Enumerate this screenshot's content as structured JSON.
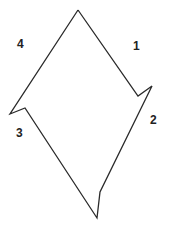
{
  "diagram": {
    "stroke_color": "#2a2a2a",
    "background": "#ffffff",
    "outline_points": [
      [
        78,
        10
      ],
      [
        138,
        96
      ],
      [
        152,
        86
      ],
      [
        100,
        192
      ],
      [
        97,
        218
      ],
      [
        25,
        108
      ],
      [
        10,
        114
      ],
      [
        78,
        10
      ]
    ],
    "labels": [
      {
        "id": "1",
        "text": "1",
        "x": 136,
        "y": 46
      },
      {
        "id": "2",
        "text": "2",
        "x": 153,
        "y": 120
      },
      {
        "id": "3",
        "text": "3",
        "x": 19,
        "y": 133
      },
      {
        "id": "4",
        "text": "4",
        "x": 20,
        "y": 44
      }
    ]
  }
}
